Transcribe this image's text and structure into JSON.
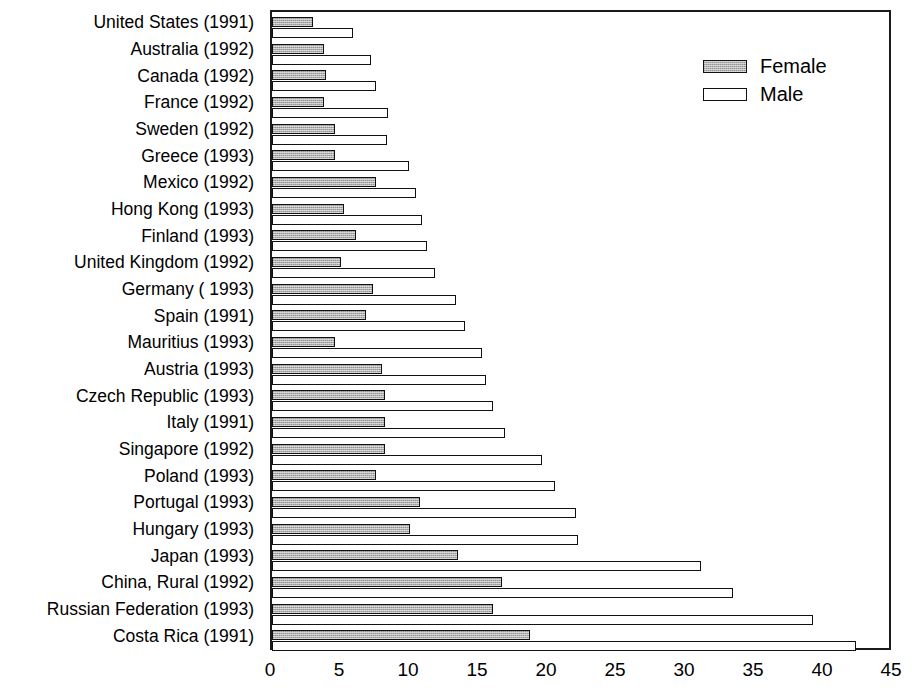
{
  "chart_data": {
    "type": "bar",
    "orientation": "horizontal",
    "title": "",
    "subtitle": "",
    "xlabel": "",
    "ylabel": "",
    "xlim": [
      0,
      45
    ],
    "xticks": [
      "0",
      "5",
      "10",
      "15",
      "20",
      "25",
      "30",
      "35",
      "40",
      "45"
    ],
    "grid": false,
    "legend_position": "top-right",
    "categories": [
      "United States (1991)",
      "Australia (1992)",
      "Canada (1992)",
      "France (1992)",
      "Sweden (1992)",
      "Greece (1993)",
      "Mexico (1992)",
      "Hong Kong (1993)",
      "Finland (1993)",
      "United Kingdom (1992)",
      "Germany ( 1993)",
      "Spain (1991)",
      "Mauritius (1993)",
      "Austria (1993)",
      "Czech Republic (1993)",
      "Italy (1991)",
      "Singapore (1992)",
      "Poland (1993)",
      "Portugal (1993)",
      "Hungary (1993)",
      "Japan (1993)",
      "China, Rural (1992)",
      "Russian Federation (1993)",
      "Costa Rica (1991)"
    ],
    "series": [
      {
        "name": "Female",
        "color": "#a8a8a8",
        "values": [
          3.0,
          3.8,
          3.9,
          3.8,
          4.6,
          4.6,
          7.5,
          5.2,
          6.1,
          5.0,
          7.3,
          6.8,
          4.6,
          8.0,
          8.2,
          8.2,
          8.2,
          7.5,
          10.7,
          10.0,
          13.5,
          16.7,
          16.0,
          18.7
        ]
      },
      {
        "name": "Male",
        "color": "#ffffff",
        "values": [
          5.9,
          7.2,
          7.5,
          8.4,
          8.3,
          9.9,
          10.4,
          10.9,
          11.2,
          11.8,
          13.3,
          14.0,
          15.2,
          15.5,
          16.0,
          16.9,
          19.6,
          20.5,
          22.0,
          22.2,
          31.1,
          33.4,
          39.2,
          42.3
        ]
      }
    ]
  },
  "legend": {
    "items": [
      {
        "label": "Female",
        "style": "female"
      },
      {
        "label": "Male",
        "style": "male"
      }
    ]
  }
}
